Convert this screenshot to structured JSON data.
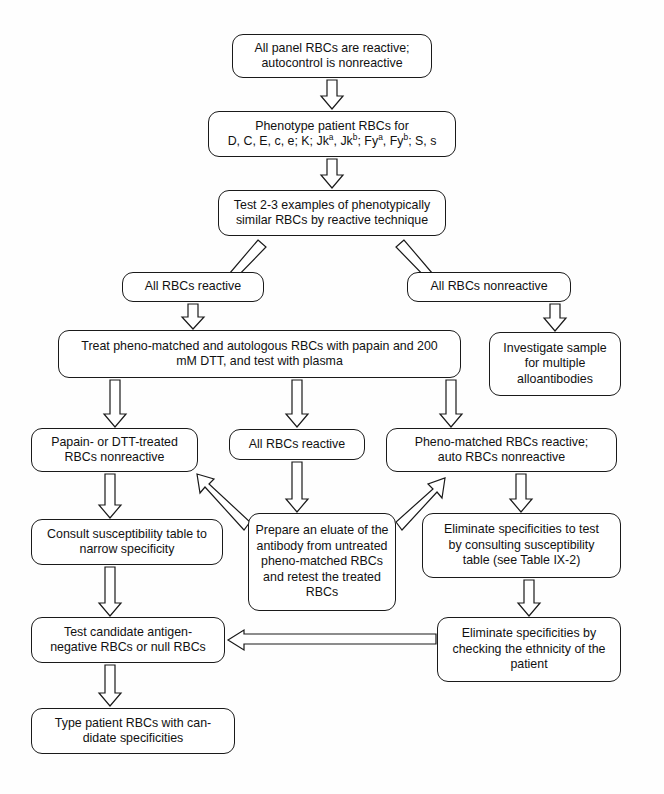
{
  "diagram": {
    "background": "#fefefe",
    "stroke": "#1a1a1a",
    "fill": "#ffffff",
    "nodes": [
      {
        "id": "n1",
        "name": "all-panel-rbcs-reactive",
        "text": "All panel RBCs are reactive;\nautocontrol is nonreactive",
        "x": 232,
        "y": 34,
        "w": 200,
        "h": 44
      },
      {
        "id": "n2",
        "name": "phenotype-patient-rbcs",
        "text": "Phenotype patient RBCs for",
        "text2": "D, C, E, c, e; K; Jk",
        "sup1": "a",
        "text3": ", Jk",
        "sup2": "b",
        "text4": "; Fy",
        "sup3": "a",
        "text5": ", Fy",
        "sup4": "b",
        "text6": "; S, s",
        "x": 208,
        "y": 111,
        "w": 248,
        "h": 46
      },
      {
        "id": "n3",
        "name": "test-examples-phenotypically-similar",
        "text": "Test 2-3 examples of phenotypically\nsimilar RBCs by reactive technique",
        "x": 218,
        "y": 190,
        "w": 228,
        "h": 46
      },
      {
        "id": "n4",
        "name": "all-rbcs-reactive-branch",
        "text": "All RBCs reactive",
        "x": 122,
        "y": 272,
        "w": 142,
        "h": 30
      },
      {
        "id": "n5",
        "name": "all-rbcs-nonreactive-branch",
        "text": "All RBCs nonreactive",
        "x": 407,
        "y": 272,
        "w": 164,
        "h": 30
      },
      {
        "id": "n6",
        "name": "treat-pheno-matched-autologous",
        "text": "Treat pheno-matched and autologous RBCs with papain and 200\nmM DTT, and test with plasma",
        "x": 58,
        "y": 330,
        "w": 403,
        "h": 48
      },
      {
        "id": "n7",
        "name": "investigate-sample-multiple-alloantibodies",
        "text": "Investigate sample\nfor multiple\nalloantibodies",
        "x": 489,
        "y": 332,
        "w": 132,
        "h": 64
      },
      {
        "id": "n8",
        "name": "papain-dtt-treated-rbcs-nonreactive",
        "text": "Papain- or DTT-treated\nRBCs nonreactive",
        "x": 31,
        "y": 428,
        "w": 167,
        "h": 44
      },
      {
        "id": "n9",
        "name": "all-rbcs-reactive-mid",
        "text": "All RBCs reactive",
        "x": 229,
        "y": 429,
        "w": 136,
        "h": 31
      },
      {
        "id": "n10",
        "name": "pheno-matched-reactive-auto-nonreactive",
        "text": "Pheno-matched RBCs reactive;\nauto RBCs nonreactive",
        "x": 386,
        "y": 428,
        "w": 231,
        "h": 44
      },
      {
        "id": "n11",
        "name": "consult-susceptibility-table",
        "text": "Consult susceptibility table to\nnarrow specificity",
        "x": 31,
        "y": 519,
        "w": 192,
        "h": 46
      },
      {
        "id": "n12",
        "name": "prepare-eluate-antibody",
        "text": "Prepare an eluate of the\nantibody from untreated\npheno-matched RBCs\nand retest the treated\nRBCs",
        "x": 248,
        "y": 513,
        "w": 148,
        "h": 98
      },
      {
        "id": "n13",
        "name": "eliminate-specificities-consulting-table",
        "text": "Eliminate specificities to test\nby consulting susceptibility\ntable (see Table IX-2)",
        "x": 422,
        "y": 513,
        "w": 199,
        "h": 65
      },
      {
        "id": "n14",
        "name": "test-candidate-antigen-negative",
        "text": "Test candidate antigen-\nnegative RBCs or null RBCs",
        "x": 31,
        "y": 617,
        "w": 194,
        "h": 46
      },
      {
        "id": "n15",
        "name": "eliminate-specificities-ethnicity",
        "text": "Eliminate specificities by\nchecking the ethnicity of the\npatient",
        "x": 437,
        "y": 617,
        "w": 184,
        "h": 65
      },
      {
        "id": "n16",
        "name": "type-patient-rbcs-candidate",
        "text": "Type patient RBCs with can-\ndidate specificities",
        "x": 31,
        "y": 708,
        "w": 204,
        "h": 46
      }
    ],
    "edges": [
      {
        "name": "edge-n1-n2",
        "from": "n1",
        "to": "n2",
        "kind": "vertical-down"
      },
      {
        "name": "edge-n2-n3",
        "from": "n2",
        "to": "n3",
        "kind": "vertical-down"
      },
      {
        "name": "edge-n3-n4",
        "from": "n3",
        "to": "n4",
        "kind": "diagonal-down-left"
      },
      {
        "name": "edge-n3-n5",
        "from": "n3",
        "to": "n5",
        "kind": "diagonal-down-right"
      },
      {
        "name": "edge-n4-n6",
        "from": "n4",
        "to": "n6",
        "kind": "vertical-down"
      },
      {
        "name": "edge-n5-n7",
        "from": "n5",
        "to": "n7",
        "kind": "vertical-down"
      },
      {
        "name": "edge-n6-n8",
        "from": "n6",
        "to": "n8",
        "kind": "vertical-down"
      },
      {
        "name": "edge-n6-n9",
        "from": "n6",
        "to": "n9",
        "kind": "vertical-down"
      },
      {
        "name": "edge-n6-n10",
        "from": "n6",
        "to": "n10",
        "kind": "vertical-down"
      },
      {
        "name": "edge-n8-n11",
        "from": "n8",
        "to": "n11",
        "kind": "vertical-down"
      },
      {
        "name": "edge-n9-n12",
        "from": "n9",
        "to": "n12",
        "kind": "vertical-down"
      },
      {
        "name": "edge-n10-n13",
        "from": "n10",
        "to": "n13",
        "kind": "vertical-down"
      },
      {
        "name": "edge-n12-n8",
        "from": "n12",
        "to": "n8",
        "kind": "diagonal-up-left"
      },
      {
        "name": "edge-n12-n10",
        "from": "n12",
        "to": "n10",
        "kind": "diagonal-up-right"
      },
      {
        "name": "edge-n11-n14",
        "from": "n11",
        "to": "n14",
        "kind": "vertical-down"
      },
      {
        "name": "edge-n13-n15",
        "from": "n13",
        "to": "n15",
        "kind": "vertical-down"
      },
      {
        "name": "edge-n15-n14",
        "from": "n15",
        "to": "n14",
        "kind": "horizontal-left"
      },
      {
        "name": "edge-n14-n16",
        "from": "n14",
        "to": "n16",
        "kind": "vertical-down"
      }
    ]
  }
}
